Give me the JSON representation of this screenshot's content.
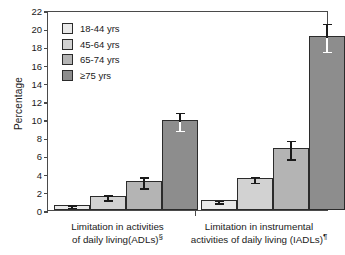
{
  "chart_data": {
    "type": "bar",
    "title": "",
    "xlabel": "",
    "ylabel": "Percentage",
    "ylim": [
      0,
      22
    ],
    "ytick_step": 2,
    "yticks": [
      "22",
      "20",
      "18",
      "16",
      "14",
      "12",
      "10",
      "8",
      "6",
      "4",
      "2",
      "0"
    ],
    "grid": false,
    "legend_position": "upper-left-inside",
    "categories": [
      "Limitation in activities of daily living(ADLs)§",
      "Limitation in instrumental activities of daily living (IADLs)¶"
    ],
    "series": [
      {
        "name": "18-44 yrs",
        "color": "#e9e9e9",
        "values": [
          0.6,
          1.1
        ],
        "err_low": [
          0.45,
          0.95
        ],
        "err_high": [
          0.75,
          1.25
        ]
      },
      {
        "name": "45-64 yrs",
        "color": "#d2d2d2",
        "values": [
          1.55,
          3.5
        ],
        "err_low": [
          1.3,
          3.2
        ],
        "err_high": [
          1.85,
          3.85
        ]
      },
      {
        "name": "65-74  yrs",
        "color": "#b4b4b4",
        "values": [
          3.2,
          6.8
        ],
        "err_low": [
          2.6,
          5.8
        ],
        "err_high": [
          3.8,
          7.8
        ]
      },
      {
        "name": "≥75  yrs",
        "color": "#8d8d8d",
        "values": [
          9.9,
          19.1
        ],
        "err_low": [
          8.9,
          17.6
        ],
        "err_high": [
          10.9,
          20.7
        ]
      }
    ]
  },
  "axes": {
    "y_title": "Percentage"
  },
  "legend": {
    "items": [
      {
        "label": "18-44 yrs"
      },
      {
        "label": "45-64 yrs"
      },
      {
        "label": "65-74  yrs"
      },
      {
        "label": "≥75  yrs"
      }
    ]
  },
  "xcaptions": [
    {
      "line1": "Limitation in activities",
      "line2": "of daily living(ADLs)",
      "marker": "§"
    },
    {
      "line1": "Limitation in instrumental",
      "line2": "activities of daily living (IADLs)",
      "marker": "¶"
    }
  ]
}
